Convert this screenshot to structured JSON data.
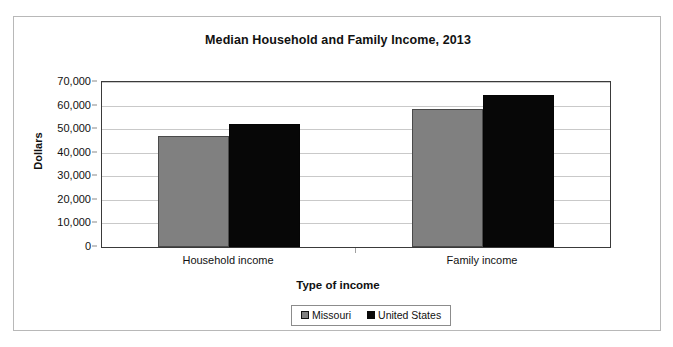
{
  "chart_data": {
    "type": "bar",
    "title": "Median Household and Family Income, 2013",
    "xlabel": "Type of income",
    "ylabel": "Dollars",
    "categories": [
      "Household income",
      "Family income"
    ],
    "series": [
      {
        "name": "Missouri",
        "color": "#808080",
        "values": [
          47200,
          58400
        ]
      },
      {
        "name": "United States",
        "color": "#0a0a0a",
        "values": [
          52300,
          64500
        ]
      }
    ],
    "ylim": [
      0,
      70000
    ],
    "ytick_values": [
      0,
      10000,
      20000,
      30000,
      40000,
      50000,
      60000,
      70000
    ],
    "ytick_labels": [
      "0",
      "10,000",
      "20,000",
      "30,000",
      "40,000",
      "50,000",
      "60,000",
      "70,000"
    ],
    "grid": true,
    "legend_position": "bottom"
  },
  "legend": {
    "entries": [
      {
        "label": "Missouri"
      },
      {
        "label": "United States"
      }
    ]
  }
}
